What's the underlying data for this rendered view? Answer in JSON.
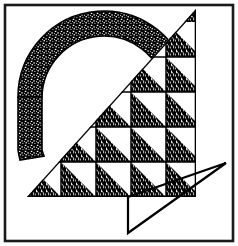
{
  "artwork": {
    "title": "Abstract letter-A emblem",
    "description": "Framed black-and-white logo: stippled arc over a checkerboard triangle grid with an outline triangle at lower right",
    "canvas": {
      "width": 238,
      "height": 246,
      "background": "#ffffff"
    },
    "colors": {
      "ink": "#000000",
      "paper": "#ffffff",
      "frame_stroke": "#1a1a1a",
      "texture_ink": "#111111"
    },
    "frame": {
      "name": "outer-border",
      "x": 5,
      "y": 5,
      "width": 228,
      "height": 236,
      "stroke_width": 2.6
    },
    "arc": {
      "name": "stippled-arc",
      "center_x": 104,
      "center_y": 94,
      "outer_radius": 86,
      "inner_radius": 62,
      "start_angle_deg": 182,
      "end_angle_deg": 352,
      "fill": "texture-stipple"
    },
    "triangle_grid": {
      "name": "checkerboard-triangle",
      "apex_x": 196,
      "apex_y": 9,
      "baseline_y": 197,
      "left_x": 27,
      "cell_size": 35,
      "columns": 5,
      "rows": 4,
      "row_labels": [
        "row-1",
        "row-2",
        "row-3",
        "row-4"
      ],
      "filled_pattern_note": "each occupied cell shows its lower-left half filled with vertical dash texture",
      "cells": [
        {
          "row": 0,
          "col": 4,
          "filled": true
        },
        {
          "row": 1,
          "col": 3,
          "filled": true
        },
        {
          "row": 1,
          "col": 4,
          "filled": true
        },
        {
          "row": 2,
          "col": 2,
          "filled": true
        },
        {
          "row": 2,
          "col": 3,
          "filled": true
        },
        {
          "row": 2,
          "col": 4,
          "filled": true
        },
        {
          "row": 3,
          "col": 1,
          "filled": true
        },
        {
          "row": 3,
          "col": 2,
          "filled": true
        },
        {
          "row": 3,
          "col": 3,
          "filled": true
        },
        {
          "row": 3,
          "col": 4,
          "filled": true
        }
      ]
    },
    "outline_triangle": {
      "name": "lower-right-outline-triangle",
      "points": "128,197 226,163 128,233",
      "fill": "none",
      "stroke_width": 2.2
    }
  }
}
